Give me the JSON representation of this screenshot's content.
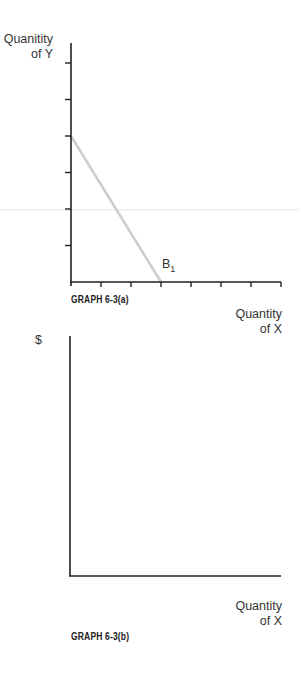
{
  "chart_data": [
    {
      "type": "line",
      "title": "GRAPH 6-3(a)",
      "xlabel": "Quantity of X",
      "ylabel": "Quanitity of Y",
      "xlim": [
        0,
        7
      ],
      "ylim": [
        0,
        6.5
      ],
      "x_ticks": [
        1,
        2,
        3,
        4,
        5,
        6,
        7
      ],
      "y_ticks": [
        1,
        2,
        3,
        4,
        5,
        6
      ],
      "grid": false,
      "series": [
        {
          "name": "B1",
          "label": "B",
          "label_subscript": "1",
          "color": "#cccccc",
          "points": [
            [
              0,
              4
            ],
            [
              3,
              0
            ]
          ]
        }
      ]
    },
    {
      "type": "line",
      "title": "GRAPH 6-3(b)",
      "xlabel": "Quantity of X",
      "ylabel": "$",
      "grid": false,
      "series": []
    }
  ],
  "graph_a": {
    "ylabel_line1": "Quanitity",
    "ylabel_line2": "of Y",
    "xlabel_line1": "Quantity",
    "xlabel_line2": "of X",
    "caption": "GRAPH 6-3(a)",
    "curve_label": "B",
    "curve_label_sub": "1"
  },
  "graph_b": {
    "ylabel": "$",
    "xlabel_line1": "Quantity",
    "xlabel_line2": "of X",
    "caption": "GRAPH 6-3(b)"
  },
  "colors": {
    "axis": "#222222",
    "budget_line": "#cccccc"
  }
}
